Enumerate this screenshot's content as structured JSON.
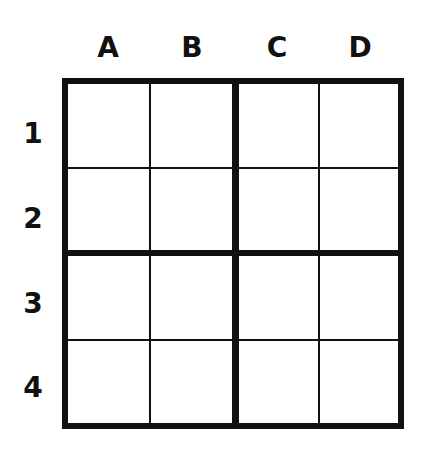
{
  "grid": {
    "columns": [
      "A",
      "B",
      "C",
      "D"
    ],
    "rows": [
      "1",
      "2",
      "3",
      "4"
    ],
    "cells": [
      [
        "",
        "",
        "",
        ""
      ],
      [
        "",
        "",
        "",
        ""
      ],
      [
        "",
        "",
        "",
        ""
      ],
      [
        "",
        "",
        "",
        ""
      ]
    ],
    "line_color": "#111111",
    "background": "#ffffff"
  }
}
